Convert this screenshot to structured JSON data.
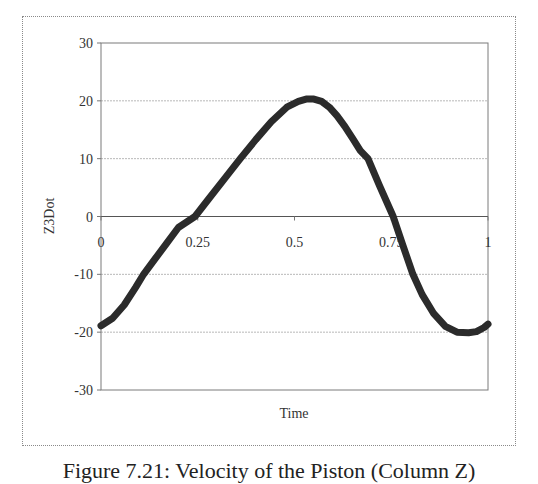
{
  "chart_data": {
    "type": "line",
    "title": "",
    "xlabel": "Time",
    "ylabel": "Z3Dot",
    "xlim": [
      0,
      1
    ],
    "ylim": [
      -30,
      30
    ],
    "x_ticks": [
      "0",
      "0.25",
      "0.5",
      "0.75",
      "1"
    ],
    "x_tick_values": [
      0,
      0.25,
      0.5,
      0.75,
      1
    ],
    "y_ticks": [
      "30",
      "20",
      "10",
      "0",
      "-10",
      "-20",
      "-30"
    ],
    "y_tick_values": [
      30,
      20,
      10,
      0,
      -10,
      -20,
      -30
    ],
    "grid": {
      "horizontal": true,
      "vertical": false
    },
    "legend": null,
    "series": [
      {
        "name": "Z3Dot",
        "color": "#2b2b2b",
        "x": [
          0,
          0.03,
          0.06,
          0.09,
          0.11,
          0.14,
          0.17,
          0.2,
          0.243,
          0.28,
          0.32,
          0.36,
          0.4,
          0.44,
          0.48,
          0.51,
          0.53,
          0.55,
          0.57,
          0.59,
          0.61,
          0.63,
          0.65,
          0.67,
          0.69,
          0.72,
          0.755,
          0.78,
          0.806,
          0.83,
          0.86,
          0.89,
          0.92,
          0.95,
          0.97,
          0.99,
          1.0
        ],
        "values": [
          -18.9,
          -17.6,
          -15.3,
          -12.2,
          -10.0,
          -7.3,
          -4.6,
          -1.9,
          0.0,
          3.2,
          6.6,
          10.0,
          13.3,
          16.4,
          18.9,
          19.9,
          20.3,
          20.3,
          19.9,
          18.9,
          17.4,
          15.6,
          13.5,
          11.4,
          10.0,
          5.3,
          0.0,
          -5.0,
          -10.0,
          -13.5,
          -16.8,
          -19.0,
          -20.0,
          -20.1,
          -19.9,
          -19.2,
          -18.6
        ]
      }
    ]
  },
  "figure": {
    "caption": "Figure 7.21: Velocity of the Piston (Column Z)"
  }
}
